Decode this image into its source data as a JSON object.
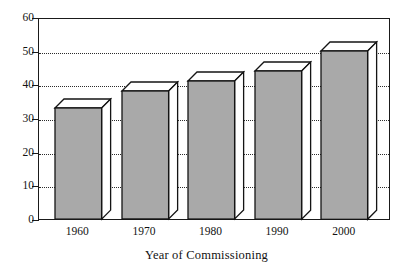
{
  "chart_data": {
    "type": "bar",
    "title": "",
    "subtitle": "",
    "xlabel": "Year of Commissioning",
    "ylabel": "",
    "categories": [
      "1960",
      "1970",
      "1980",
      "1990",
      "2000"
    ],
    "values": [
      33,
      38,
      41,
      44,
      50
    ],
    "series": [
      {
        "name": "",
        "values": [
          33,
          38,
          41,
          44,
          50
        ]
      }
    ],
    "ylim": [
      0,
      60
    ],
    "ytick_labels": [
      "0",
      "10",
      "20",
      "30",
      "40",
      "50",
      "60"
    ],
    "ytick_values": [
      0,
      10,
      20,
      30,
      40,
      50,
      60
    ],
    "gridline_values": [
      10,
      20,
      30,
      40,
      50
    ],
    "grid": "horizontal-dotted",
    "legend": "none",
    "style": "3d-bars",
    "colors": {
      "bar_front": "#a9a9a9",
      "bar_top": "#ffffff",
      "bar_side": "#ffffff",
      "outline": "#141414",
      "gridline": "#2b2b2b",
      "axis": "#1a1a1a",
      "background": "#ffffff",
      "text": "#121212"
    }
  }
}
